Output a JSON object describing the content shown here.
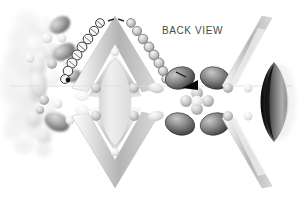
{
  "figure": {
    "title": "BACK VIEW",
    "background_color": "#ffffff",
    "width": 299,
    "height": 203,
    "style": "grayscale airbrushed technical illustration",
    "label": {
      "text": "BACK VIEW",
      "color": "#4a4a4a",
      "x": 162,
      "y": 25,
      "font_size": 10
    },
    "palette": {
      "background": "#ffffff",
      "black": "#0a0a0a",
      "dark_gray": "#3a3a3a",
      "mid_gray": "#8e8e8e",
      "light_gray": "#c9c9c9",
      "pale_gray": "#e4e4e4",
      "faint_gray": "#f1f1f1",
      "outline": "#5a5a5a"
    },
    "axis_line": {
      "name": "horizontal-center-axis",
      "color": "#d8d8d8",
      "y": 86,
      "x_start": 10,
      "x_end": 292
    },
    "elements": [
      {
        "name": "left-blurred-cluster",
        "type": "blob-cluster",
        "description": "soft out-of-focus cluster of pale pebbles at far left",
        "count": 18,
        "tone": "pale"
      },
      {
        "name": "left-chevron-top",
        "type": "chevron",
        "description": "upward pointing gray chevron band left of center",
        "tone": "mid"
      },
      {
        "name": "left-chevron-bottom",
        "type": "chevron",
        "description": "downward pointing gray chevron band left of center",
        "tone": "mid"
      },
      {
        "name": "bead-chain-left",
        "type": "bead-chain",
        "description": "chain of outlined circles running down-left along chevron edge",
        "count": 9,
        "fill": "outlined"
      },
      {
        "name": "bead-chain-right",
        "type": "bead-chain",
        "description": "chain of shaded spheres running down-right along chevron edge",
        "count": 9,
        "fill": "shaded"
      },
      {
        "name": "center-lens",
        "type": "lens",
        "description": "large pale vertical almond shape at center",
        "tone": "pale"
      },
      {
        "name": "dark-blob-quad",
        "type": "blob-group",
        "description": "four dark shaded blobs arranged around a small sphere cluster",
        "count": 4,
        "tone": "dark"
      },
      {
        "name": "small-sphere-rosette",
        "type": "sphere-group",
        "description": "five small gray spheres forming a plus shape",
        "count": 5,
        "tone": "light"
      },
      {
        "name": "arrow-pointer",
        "type": "arrow",
        "description": "solid black triangular pointer aiming left toward a blob",
        "tone": "black"
      },
      {
        "name": "apex-dash-marker",
        "type": "dash",
        "description": "small dark dash at the apex of the upper chevron",
        "tone": "dark"
      },
      {
        "name": "right-chevron-top",
        "type": "chevron-arm",
        "description": "long pale diagonal band descending to the right",
        "tone": "light"
      },
      {
        "name": "right-chevron-bottom",
        "type": "chevron-arm",
        "description": "long pale diagonal band ascending to the right",
        "tone": "light"
      },
      {
        "name": "right-dark-lens",
        "type": "lens",
        "description": "dark almond lens with black left edge at far right",
        "tone": "black-gradient"
      }
    ]
  }
}
